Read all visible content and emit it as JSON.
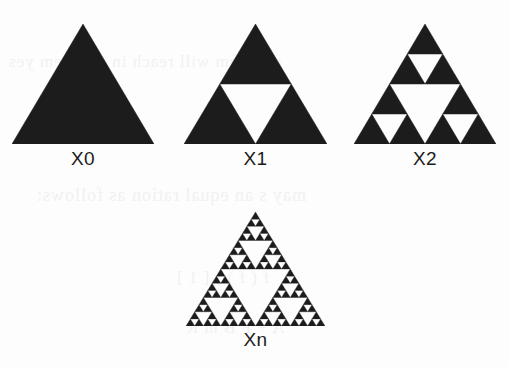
{
  "page": {
    "background_color": "#fdfdfd",
    "ink_color": "#1c1c1c",
    "ghost_text_color": "#f1f1f1",
    "width": 509,
    "height": 367
  },
  "figures": [
    {
      "id": "x0",
      "label": "X0",
      "iteration": 0,
      "depth": 0,
      "description": "solid filled equilateral triangle",
      "x": 12,
      "y": 24,
      "size": 142,
      "height": 120,
      "label_y": 148
    },
    {
      "id": "x1",
      "label": "X1",
      "iteration": 1,
      "depth": 1,
      "description": "triangle with central inverted triangle removed",
      "x": 184,
      "y": 24,
      "size": 143,
      "height": 120,
      "label_y": 148
    },
    {
      "id": "x2",
      "label": "X2",
      "iteration": 2,
      "depth": 2,
      "description": "second iteration Sierpinski gasket",
      "x": 354,
      "y": 24,
      "size": 142,
      "height": 120,
      "label_y": 148
    },
    {
      "id": "xn",
      "label": "Xn",
      "iteration": "n",
      "depth": 4,
      "description": "nth iteration Sierpinski gasket (limit set)",
      "x": 186,
      "y": 212,
      "size": 139,
      "height": 114,
      "label_y": 329
    }
  ],
  "ghost_lines": [
    {
      "text": "a system   will reach in a system yes",
      "x": 8,
      "y": 52,
      "size": 17
    },
    {
      "text": "may    s an equal ration as follows:",
      "x": 36,
      "y": 185,
      "size": 18
    },
    {
      "text": "f (  f )   ) [ 1 ]",
      "x": 176,
      "y": 268,
      "size": 17
    },
    {
      "text": "A  +  F  B  m  R",
      "x": 186,
      "y": 318,
      "size": 17
    }
  ]
}
